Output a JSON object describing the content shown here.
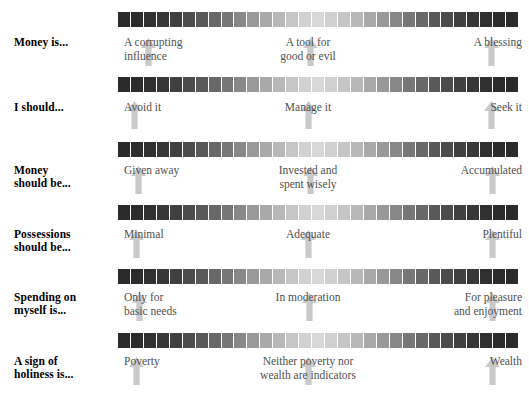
{
  "figure": {
    "type": "scale-diagram",
    "bar_segment_count": 31,
    "arrow_color": "#c9c9c9",
    "label_color": "#4f4f4f",
    "stub_color": "#000000",
    "bar_dark_color": "#2b2b2b",
    "bar_light_color": "#d8d8d8",
    "divider_color": "#ffffff"
  },
  "rows": [
    {
      "stub": "Money is...",
      "left": "A corrupting\ninfluence",
      "mid": "A tool for\ngood or evil",
      "right": "A blessing",
      "bar_top": 12,
      "label_top": 36,
      "arrow_top": 38,
      "arrow_left_x": 148,
      "arrow_mid_x": 310,
      "arrow_right_x": 491
    },
    {
      "stub": "I should...",
      "left": "Avoid it",
      "mid": "Manage it",
      "right": "Seek it",
      "bar_top": 77,
      "label_top": 101,
      "arrow_top": 101,
      "arrow_left_x": 134,
      "arrow_mid_x": 308,
      "arrow_right_x": 491
    },
    {
      "stub": "Money\nshould be...",
      "left": "Given away",
      "mid": "Invested and\nspent wisely",
      "right": "Accumulated",
      "bar_top": 142,
      "label_top": 164,
      "arrow_top": 166,
      "arrow_left_x": 138,
      "arrow_mid_x": 310,
      "arrow_right_x": 492
    },
    {
      "stub": "Possessions\nshould be...",
      "left": "Minimal",
      "mid": "Adequate",
      "right": "Plentiful",
      "bar_top": 205,
      "label_top": 228,
      "arrow_top": 230,
      "arrow_left_x": 136,
      "arrow_mid_x": 308,
      "arrow_right_x": 492
    },
    {
      "stub": "Spending on\nmyself is...",
      "left": "Only for\nbasic needs",
      "mid": "In moderation",
      "right": "For pleasure\nand enjoyment",
      "bar_top": 269,
      "label_top": 291,
      "arrow_top": 293,
      "arrow_left_x": 139,
      "arrow_mid_x": 309,
      "arrow_right_x": 492
    },
    {
      "stub": "A sign of\nholiness is...",
      "left": "Poverty",
      "mid": "Neither poverty nor\nwealth are indicators",
      "right": "Wealth",
      "bar_top": 333,
      "label_top": 355,
      "arrow_top": 357,
      "arrow_left_x": 136,
      "arrow_mid_x": 308,
      "arrow_right_x": 492
    }
  ]
}
